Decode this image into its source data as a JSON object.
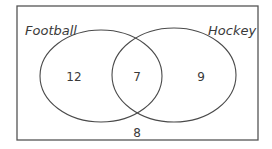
{
  "diagram": {
    "type": "venn",
    "sets": [
      {
        "name": "Football",
        "label": "Football"
      },
      {
        "name": "Hockey",
        "label": "Hockey"
      }
    ],
    "regions": {
      "football_only": "12",
      "both": "7",
      "hockey_only": "9",
      "neither": "8"
    },
    "colors": {
      "stroke": "#4a4a4a",
      "text": "#3a3a3a",
      "background": "#ffffff"
    }
  }
}
